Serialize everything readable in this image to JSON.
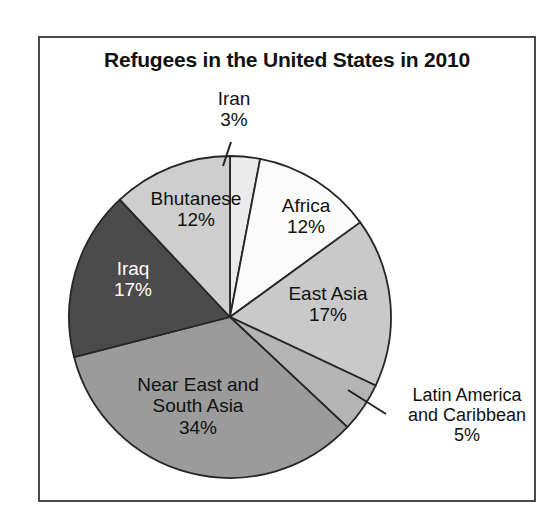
{
  "figure": {
    "title": "Refugees in the United States in 2010",
    "frame_color": "#4a4a4a",
    "background": "#ffffff"
  },
  "chart_data": {
    "type": "pie",
    "title": "Refugees in the United States in 2010",
    "xlabel": "",
    "ylabel": "",
    "legend": "none (direct slice labels)",
    "grid": false,
    "units": "percent",
    "total": 100,
    "start_angle_deg": 0,
    "direction": "clockwise",
    "categories": [
      "Iran",
      "Africa",
      "East Asia",
      "Latin America and Caribbean",
      "Near East and South Asia",
      "Iraq",
      "Bhutanese"
    ],
    "values": [
      3,
      12,
      17,
      5,
      34,
      17,
      12
    ],
    "slices": [
      {
        "name": "Iran",
        "label": "Iran",
        "value": 3,
        "value_label": "3%",
        "color": "#ebebeb",
        "label_placement": "outside-callout",
        "text_color": "#111111"
      },
      {
        "name": "Africa",
        "label": "Africa",
        "value": 12,
        "value_label": "12%",
        "color": "#fbfbfb",
        "label_placement": "inside",
        "text_color": "#111111"
      },
      {
        "name": "East Asia",
        "label": "East Asia",
        "value": 17,
        "value_label": "17%",
        "color": "#c9c9c9",
        "label_placement": "inside",
        "text_color": "#111111"
      },
      {
        "name": "Latin America and Caribbean",
        "label": "Latin America and Caribbean",
        "label_line1": "Latin America",
        "label_line2": "and Caribbean",
        "value": 5,
        "value_label": "5%",
        "color": "#b4b4b4",
        "label_placement": "outside-callout",
        "text_color": "#111111"
      },
      {
        "name": "Near East and South Asia",
        "label": "Near East and South Asia",
        "label_line1": "Near East and",
        "label_line2": "South Asia",
        "value": 34,
        "value_label": "34%",
        "color": "#9b9b9b",
        "label_placement": "inside",
        "text_color": "#111111"
      },
      {
        "name": "Iraq",
        "label": "Iraq",
        "value": 17,
        "value_label": "17%",
        "color": "#4b4b4b",
        "label_placement": "inside",
        "text_color": "#ffffff"
      },
      {
        "name": "Bhutanese",
        "label": "Bhutanese",
        "value": 12,
        "value_label": "12%",
        "color": "#cecece",
        "label_placement": "inside",
        "text_color": "#111111"
      }
    ]
  }
}
